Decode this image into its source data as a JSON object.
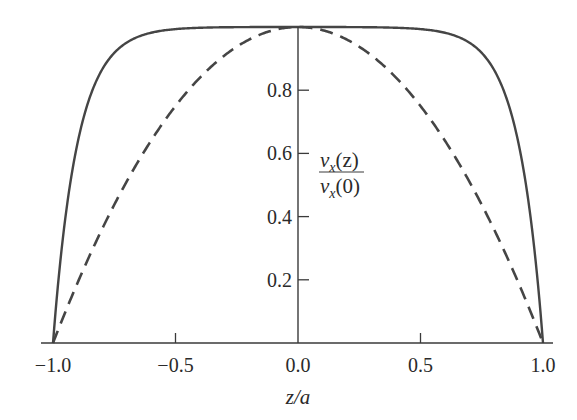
{
  "chart_data": {
    "type": "line",
    "title": "",
    "xlabel": "z/a",
    "ylabel": "v_x(z) / v_x(0)",
    "ylabel_numerator": "v",
    "ylabel_numerator_sub": "x",
    "ylabel_numerator_arg": "(z)",
    "ylabel_denominator": "v",
    "ylabel_denominator_sub": "x",
    "ylabel_denominator_arg": "(0)",
    "xlim": [
      -1.0,
      1.0
    ],
    "ylim": [
      0,
      1.0
    ],
    "x_ticks": [
      "−1.0",
      "−0.5",
      "0.0",
      "0.5",
      "1.0"
    ],
    "x_tick_values": [
      -1.0,
      -0.5,
      0.0,
      0.5,
      1.0
    ],
    "y_ticks": [
      "0.2",
      "0.4",
      "0.6",
      "0.8"
    ],
    "y_tick_values": [
      0.2,
      0.4,
      0.6,
      0.8
    ],
    "grid": false,
    "legend": null,
    "x": [
      -1.0,
      -0.95,
      -0.9,
      -0.8,
      -0.7,
      -0.6,
      -0.5,
      -0.4,
      -0.3,
      -0.2,
      -0.1,
      0.0,
      0.1,
      0.2,
      0.3,
      0.4,
      0.5,
      0.6,
      0.7,
      0.8,
      0.9,
      0.95,
      1.0
    ],
    "series": [
      {
        "name": "solid (flat profile)",
        "style": "solid",
        "values": [
          0.0,
          0.39,
          0.63,
          0.86,
          0.95,
          0.98,
          0.99,
          1.0,
          1.0,
          1.0,
          1.0,
          1.0,
          1.0,
          1.0,
          1.0,
          1.0,
          0.99,
          0.98,
          0.95,
          0.86,
          0.63,
          0.39,
          0.0
        ]
      },
      {
        "name": "dashed (parabolic profile)",
        "style": "dashed",
        "values": [
          0.0,
          0.0975,
          0.19,
          0.36,
          0.51,
          0.64,
          0.75,
          0.84,
          0.91,
          0.96,
          0.99,
          1.0,
          0.99,
          0.96,
          0.91,
          0.84,
          0.75,
          0.64,
          0.51,
          0.36,
          0.19,
          0.0975,
          0.0
        ]
      }
    ]
  }
}
